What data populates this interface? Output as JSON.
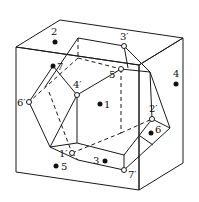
{
  "figure": {
    "colors": {
      "line": "#1a1a1a",
      "background": "#ffffff"
    }
  },
  "face_points": [
    {
      "label": "1",
      "x": 100,
      "y": 104
    },
    {
      "label": "2",
      "x": 55,
      "y": 42
    },
    {
      "label": "3",
      "x": 105,
      "y": 161
    },
    {
      "label": "4",
      "x": 176,
      "y": 84
    },
    {
      "label": "5",
      "x": 56,
      "y": 166
    },
    {
      "label": "6",
      "x": 151,
      "y": 133
    },
    {
      "label": "7",
      "x": 53,
      "y": 66
    }
  ],
  "vertex_points": [
    {
      "label": "1′",
      "x": 72,
      "y": 153
    },
    {
      "label": "2′",
      "x": 152,
      "y": 119
    },
    {
      "label": "3′",
      "x": 124,
      "y": 46
    },
    {
      "label": "4′",
      "x": 77,
      "y": 95
    },
    {
      "label": "5′",
      "x": 121,
      "y": 69
    },
    {
      "label": "6′",
      "x": 29,
      "y": 102
    },
    {
      "label": "7′",
      "x": 124,
      "y": 170
    }
  ]
}
